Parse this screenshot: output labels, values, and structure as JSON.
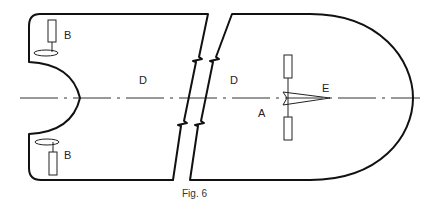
{
  "figure": {
    "caption": "Fig. 6",
    "labels": {
      "b_top": "B",
      "b_bottom": "B",
      "d_left": "D",
      "d_right": "D",
      "a": "A",
      "e": "E"
    },
    "colors": {
      "stroke": "#111111",
      "background": "#ffffff"
    }
  }
}
